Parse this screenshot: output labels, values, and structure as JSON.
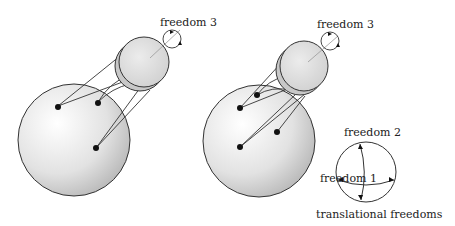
{
  "labels": {
    "left_rotation": "freedom 3",
    "right_rotation": "freedom 3",
    "freedom_1": "freedom 1",
    "freedom_2": "freedom 2",
    "translational": "translational freedoms"
  },
  "colors": {
    "stroke": "#333333",
    "sphere_light": "#ffffff",
    "sphere_dark": "#b8b8b8",
    "disk_fill": "#dcdcdc",
    "dot": "#111111"
  }
}
